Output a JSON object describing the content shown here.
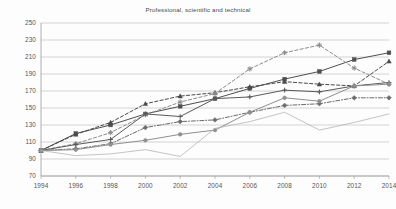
{
  "chart_data": {
    "type": "line",
    "title": "Professional, scientific and technical",
    "xlabel": "",
    "ylabel": "",
    "x": [
      1994,
      1996,
      1998,
      2000,
      2002,
      2004,
      2006,
      2008,
      2010,
      2012,
      2014
    ],
    "xtick_labels": [
      "1994",
      "1996",
      "1998",
      "2000",
      "2002",
      "2004",
      "2006",
      "2008",
      "2010",
      "2012",
      "2014"
    ],
    "ytick_labels": [
      "70",
      "90",
      "110",
      "130",
      "150",
      "170",
      "190",
      "210",
      "230",
      "250"
    ],
    "yticks": [
      70,
      90,
      110,
      130,
      150,
      170,
      190,
      210,
      230,
      250
    ],
    "ylim": [
      70,
      250
    ],
    "grid": true,
    "legend": "none",
    "index_base_year": 1994,
    "index_base_value": 100,
    "series": [
      {
        "name": "series-1-solid-square-dark",
        "color": "#4f4f4f",
        "style": "solid",
        "marker": "square",
        "values": [
          100,
          120,
          130,
          143,
          152,
          161,
          173,
          184,
          193,
          207,
          215
        ]
      },
      {
        "name": "series-2-dashed-triangle-dark",
        "color": "#4a4a4a",
        "style": "dashed",
        "marker": "triangle",
        "values": [
          100,
          119,
          133,
          155,
          164,
          168,
          175,
          181,
          178,
          176,
          205
        ]
      },
      {
        "name": "series-3-dashed-star-gray",
        "color": "#8c8c8c",
        "style": "dashed",
        "marker": "star",
        "values": [
          100,
          108,
          121,
          142,
          157,
          167,
          196,
          215,
          224,
          197,
          178
        ]
      },
      {
        "name": "series-4-solid-plus-dark",
        "color": "#5a5a5a",
        "style": "solid",
        "marker": "plus",
        "values": [
          100,
          107,
          113,
          143,
          140,
          161,
          163,
          171,
          169,
          176,
          180
        ]
      },
      {
        "name": "series-5-dashdot-diamond",
        "color": "#6b6b6b",
        "style": "dashdot",
        "marker": "diamond",
        "values": [
          100,
          102,
          108,
          127,
          134,
          136,
          145,
          153,
          155,
          162,
          162
        ]
      },
      {
        "name": "series-6-solid-circle-gray",
        "color": "#8f8f8f",
        "style": "solid",
        "marker": "circle",
        "values": [
          100,
          101,
          107,
          112,
          119,
          124,
          145,
          162,
          158,
          176,
          178
        ]
      },
      {
        "name": "series-7-plain-light-gray",
        "color": "#b0b0b0",
        "style": "solid",
        "marker": "none",
        "values": [
          100,
          94,
          96,
          101,
          93,
          126,
          134,
          145,
          124,
          133,
          143
        ]
      }
    ]
  },
  "axes": {
    "x_axis_name": "year-axis",
    "y_axis_name": "index-axis"
  }
}
